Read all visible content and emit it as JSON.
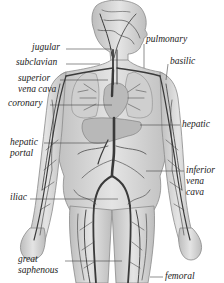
{
  "diagram": {
    "labels": {
      "jugular": "jugular",
      "subclavian": "subclavian",
      "superior_vena_cava": [
        "superior",
        "vena cava"
      ],
      "coronary": "coronary",
      "hepatic_portal": [
        "hepatic",
        "portal"
      ],
      "iliac": "iliac",
      "great_saphenous": [
        "great",
        "saphenous"
      ],
      "pulmonary": "pulmonary",
      "basilic": "basilic",
      "hepatic": "hepatic",
      "inferior_vena_cava": [
        "inferior",
        "vena",
        "cava"
      ],
      "femoral": "femoral"
    },
    "colors": {
      "background": "#ffffff",
      "body_fill": "#d9d9d9",
      "body_outline": "#8a8a8a",
      "vein": "#3a3a3a",
      "organ": "#c4c4c4",
      "leader_line": "#444444",
      "text": "#222222"
    }
  }
}
